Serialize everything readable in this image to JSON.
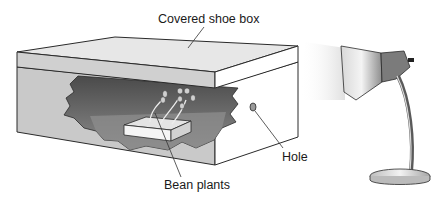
{
  "diagram": {
    "labels": {
      "box": "Covered shoe box",
      "plants": "Bean plants",
      "hole": "Hole"
    },
    "colors": {
      "outline": "#2a2a2a",
      "lid_top": "#e6e6e6",
      "lid_front": "#cfcfcf",
      "box_front": "#c8c8c8",
      "box_side": "#ffffff",
      "interior_dark": "#555555",
      "interior_mid": "#8a8a8a",
      "lamp_metal": "#b5b5b5",
      "light_beam": "#eeeeee"
    }
  }
}
